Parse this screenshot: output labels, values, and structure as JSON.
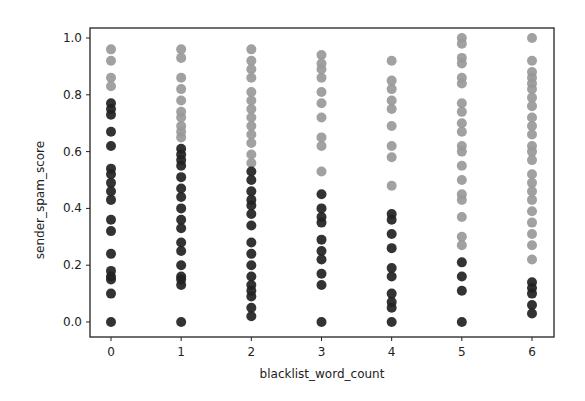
{
  "chart_data": {
    "type": "scatter",
    "title": "",
    "xlabel": "blacklist_word_count",
    "ylabel": "sender_spam_score",
    "xlim": [
      -0.3,
      6.3
    ],
    "ylim": [
      -0.035,
      1.035
    ],
    "x_ticks": [
      0,
      1,
      2,
      3,
      4,
      5,
      6
    ],
    "x_tick_labels": [
      "0",
      "1",
      "2",
      "3",
      "4",
      "5",
      "6"
    ],
    "y_ticks": [
      0.0,
      0.2,
      0.4,
      0.6,
      0.8,
      1.0
    ],
    "y_tick_labels": [
      "0.0",
      "0.2",
      "0.4",
      "0.6",
      "0.8",
      "1.0"
    ],
    "grid": false,
    "legend": null,
    "series": [
      {
        "name": "class_gray",
        "color": "#999999",
        "points": [
          {
            "x": 0,
            "y": [
              0.96,
              0.92,
              0.86,
              0.83
            ]
          },
          {
            "x": 1,
            "y": [
              0.96,
              0.93,
              0.86,
              0.82,
              0.78,
              0.74,
              0.72,
              0.69,
              0.67,
              0.65
            ]
          },
          {
            "x": 2,
            "y": [
              0.96,
              0.92,
              0.89,
              0.86,
              0.81,
              0.78,
              0.75,
              0.72,
              0.69,
              0.66,
              0.63,
              0.59,
              0.56
            ]
          },
          {
            "x": 3,
            "y": [
              0.94,
              0.91,
              0.89,
              0.86,
              0.81,
              0.77,
              0.72,
              0.65,
              0.62,
              0.53
            ]
          },
          {
            "x": 4,
            "y": [
              0.92,
              0.85,
              0.82,
              0.78,
              0.75,
              0.69,
              0.62,
              0.58,
              0.48
            ]
          },
          {
            "x": 5,
            "y": [
              1.0,
              0.98,
              0.93,
              0.91,
              0.86,
              0.84,
              0.77,
              0.74,
              0.7,
              0.67,
              0.62,
              0.6,
              0.55,
              0.5,
              0.45,
              0.43,
              0.37,
              0.3,
              0.27
            ]
          },
          {
            "x": 6,
            "y": [
              1.0,
              0.92,
              0.88,
              0.86,
              0.84,
              0.82,
              0.79,
              0.76,
              0.72,
              0.69,
              0.66,
              0.62,
              0.6,
              0.57,
              0.52,
              0.49,
              0.46,
              0.43,
              0.39,
              0.35,
              0.31,
              0.27,
              0.22
            ]
          }
        ]
      },
      {
        "name": "class_dark",
        "color": "#222222",
        "points": [
          {
            "x": 0,
            "y": [
              0.77,
              0.75,
              0.73,
              0.67,
              0.62,
              0.54,
              0.52,
              0.49,
              0.46,
              0.43,
              0.36,
              0.32,
              0.24,
              0.18,
              0.16,
              0.15,
              0.1,
              0.0
            ]
          },
          {
            "x": 1,
            "y": [
              0.61,
              0.59,
              0.57,
              0.55,
              0.51,
              0.47,
              0.44,
              0.4,
              0.36,
              0.33,
              0.28,
              0.25,
              0.2,
              0.16,
              0.15,
              0.13,
              0.0
            ]
          },
          {
            "x": 2,
            "y": [
              0.53,
              0.5,
              0.46,
              0.43,
              0.41,
              0.38,
              0.34,
              0.28,
              0.24,
              0.2,
              0.16,
              0.13,
              0.11,
              0.09,
              0.05,
              0.02
            ]
          },
          {
            "x": 3,
            "y": [
              0.45,
              0.4,
              0.37,
              0.35,
              0.29,
              0.25,
              0.22,
              0.17,
              0.13,
              0.0
            ]
          },
          {
            "x": 4,
            "y": [
              0.38,
              0.36,
              0.31,
              0.26,
              0.19,
              0.16,
              0.1,
              0.07,
              0.05,
              0.0
            ]
          },
          {
            "x": 5,
            "y": [
              0.21,
              0.16,
              0.11,
              0.0
            ]
          },
          {
            "x": 6,
            "y": [
              0.14,
              0.12,
              0.1,
              0.06,
              0.03
            ]
          }
        ]
      }
    ]
  }
}
